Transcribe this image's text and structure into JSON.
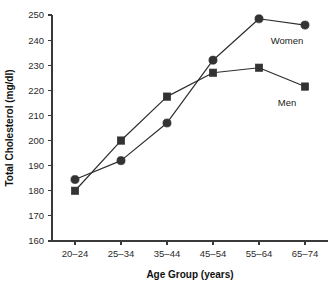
{
  "chart_data": {
    "type": "line",
    "title": "",
    "xlabel": "Age Group (years)",
    "ylabel": "Total Cholesterol (mg/dl)",
    "categories": [
      "20–24",
      "25–34",
      "35–44",
      "45–54",
      "55–64",
      "65–74"
    ],
    "ylim": [
      160,
      250
    ],
    "ytick_step": 10,
    "yticks": [
      160,
      170,
      180,
      190,
      200,
      210,
      220,
      230,
      240,
      250
    ],
    "ytick_labels": [
      "160",
      "170",
      "180",
      "190",
      "200",
      "210",
      "220",
      "230",
      "240",
      "250"
    ],
    "grid": false,
    "legend": "inline-annotations",
    "series": [
      {
        "name": "Women",
        "marker": "circle",
        "color": "#333333",
        "values": [
          184.5,
          192,
          207,
          232,
          248.5,
          246
        ],
        "annotation": {
          "label": "Women",
          "x_category_index": 4,
          "value": 240
        }
      },
      {
        "name": "Men",
        "marker": "square",
        "color": "#333333",
        "values": [
          180,
          200,
          217.5,
          227,
          229,
          221.5
        ],
        "annotation": {
          "label": "Men",
          "x_category_index": 4,
          "value": 215
        }
      }
    ]
  }
}
